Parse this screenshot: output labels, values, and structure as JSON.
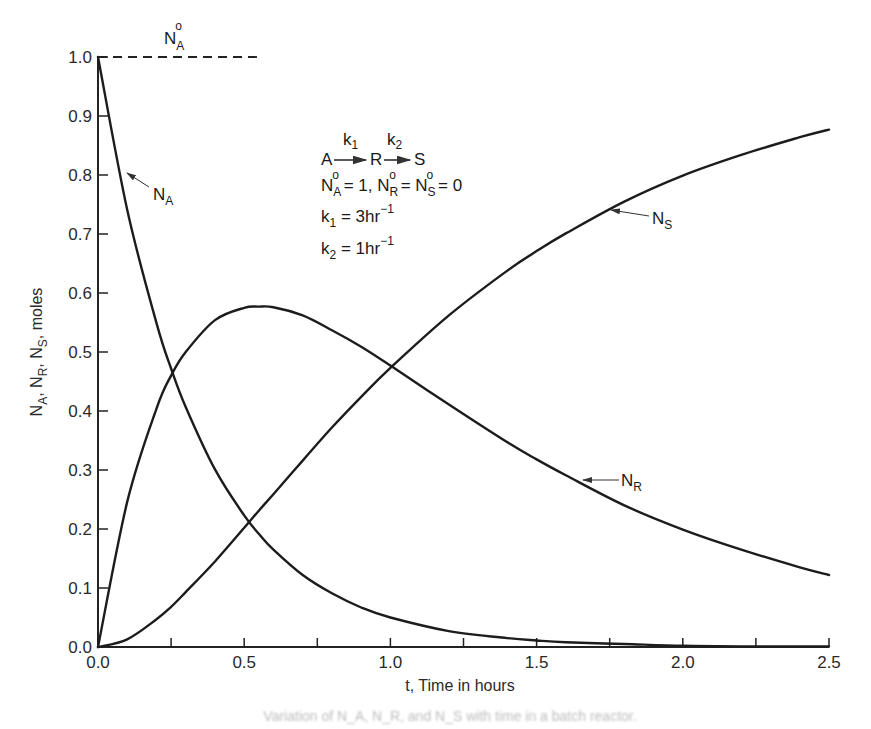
{
  "chart_data": {
    "type": "line",
    "title": "",
    "xlabel": "t, Time in hours",
    "ylabel": "N_A, N_R, N_S, moles",
    "xlim": [
      0.0,
      2.5
    ],
    "ylim": [
      0.0,
      1.0
    ],
    "grid": false,
    "x_ticks": [
      "0.0",
      "0.5",
      "1.0",
      "1.5",
      "2.0",
      "2.5"
    ],
    "x_minor_ticks": [
      0.25,
      0.75,
      1.25,
      1.75,
      2.25
    ],
    "y_ticks": [
      "0.0",
      "0.1",
      "0.2",
      "0.3",
      "0.4",
      "0.5",
      "0.6",
      "0.7",
      "0.8",
      "0.9",
      "1.0"
    ],
    "x": [
      0.0,
      0.1,
      0.2,
      0.25,
      0.3,
      0.4,
      0.5,
      0.55,
      0.6,
      0.7,
      0.8,
      0.9,
      1.0,
      1.2,
      1.4,
      1.5,
      1.6,
      1.8,
      2.0,
      2.2,
      2.4,
      2.5
    ],
    "series": [
      {
        "name": "N_A",
        "values": [
          1.0,
          0.741,
          0.549,
          0.472,
          0.407,
          0.301,
          0.223,
          0.192,
          0.165,
          0.122,
          0.091,
          0.067,
          0.05,
          0.027,
          0.015,
          0.011,
          0.008,
          0.005,
          0.002,
          0.001,
          0.001,
          0.001
        ]
      },
      {
        "name": "N_R",
        "values": [
          0.0,
          0.246,
          0.404,
          0.46,
          0.5,
          0.554,
          0.575,
          0.577,
          0.576,
          0.562,
          0.537,
          0.509,
          0.477,
          0.411,
          0.347,
          0.318,
          0.291,
          0.24,
          0.199,
          0.165,
          0.135,
          0.122
        ]
      },
      {
        "name": "N_S",
        "values": [
          0.0,
          0.013,
          0.047,
          0.068,
          0.093,
          0.145,
          0.202,
          0.231,
          0.259,
          0.316,
          0.372,
          0.424,
          0.473,
          0.562,
          0.638,
          0.671,
          0.701,
          0.755,
          0.799,
          0.834,
          0.864,
          0.877
        ]
      }
    ],
    "reference_line": {
      "label": "N_A°",
      "y": 1.0,
      "x_range": [
        0.0,
        0.5
      ],
      "style": "dashed"
    },
    "annotations": [
      {
        "text": "N_A",
        "arrow_to": [
          0.1,
          0.74
        ]
      },
      {
        "text": "N_R",
        "arrow_to": [
          1.65,
          0.28
        ]
      },
      {
        "text": "N_S",
        "arrow_to": [
          1.7,
          0.74
        ]
      }
    ],
    "legend_box": {
      "reaction": "A →(k1) R →(k2) S",
      "initial_conditions": "N_A° = 1, N_R° = N_S° = 0",
      "k1": "k1 = 3hr^-1",
      "k2": "k2 = 1hr^-1"
    }
  },
  "labels": {
    "xlabel": "t, Time in hours",
    "ylabel_parts": [
      "N",
      "A",
      ", N",
      "R",
      ", N",
      "S",
      ", moles"
    ],
    "ref_N": "N",
    "ref_sub": "A",
    "ref_sup": "o",
    "curve_A": {
      "N": "N",
      "sub": "A"
    },
    "curve_R": {
      "N": "N",
      "sub": "R"
    },
    "curve_S": {
      "N": "N",
      "sub": "S"
    },
    "box": {
      "A": "A",
      "R": "R",
      "S": "S",
      "k1_over": "k",
      "k1_over_sub": "1",
      "k2_over": "k",
      "k2_over_sub": "2",
      "ic": {
        "NA": "N",
        "NA_sub": "A",
        "eq1": " = 1, ",
        "NR": "N",
        "NR_sub": "R",
        "eq2": " = ",
        "NS": "N",
        "NS_sub": "S",
        "eq3": " = 0",
        "sup": "o"
      },
      "k1_line": {
        "k": "k",
        "sub": "1",
        "val": " = 3hr",
        "sup": "−1"
      },
      "k2_line": {
        "k": "k",
        "sub": "2",
        "val": " = 1hr",
        "sup": "−1"
      }
    },
    "caption": "Variation of N_A, N_R, and N_S with time in a batch reactor."
  }
}
